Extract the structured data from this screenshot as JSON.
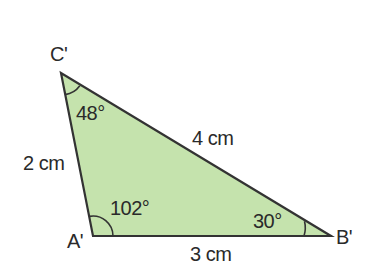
{
  "colors": {
    "fill": "#c5e3ad",
    "stroke": "#333333",
    "text": "#2a2a2a"
  },
  "vertices": {
    "A": {
      "label": "A'",
      "x": 93,
      "y": 236
    },
    "B": {
      "label": "B'",
      "x": 331,
      "y": 236
    },
    "C": {
      "label": "C'",
      "x": 61,
      "y": 73
    }
  },
  "sides": {
    "AC": "2 cm",
    "CB": "4 cm",
    "AB": "3 cm"
  },
  "angles": {
    "C": "48°",
    "A": "102°",
    "B": "30°"
  }
}
